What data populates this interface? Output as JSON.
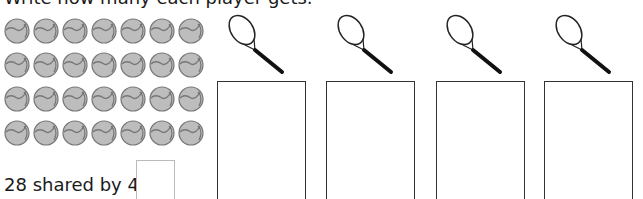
{
  "instruction": "Write how many each player gets.",
  "balls": {
    "rows": 4,
    "per_row": 7,
    "total": 28,
    "icon": "tennis-ball-icon",
    "fill": "#bdbdbd",
    "stroke": "#777777"
  },
  "players": [
    {
      "icon": "tennis-racket-icon",
      "answer": ""
    },
    {
      "icon": "tennis-racket-icon",
      "answer": ""
    },
    {
      "icon": "tennis-racket-icon",
      "answer": ""
    },
    {
      "icon": "tennis-racket-icon",
      "answer": ""
    }
  ],
  "equation": {
    "text": "28 shared by 4 =",
    "answer": ""
  }
}
